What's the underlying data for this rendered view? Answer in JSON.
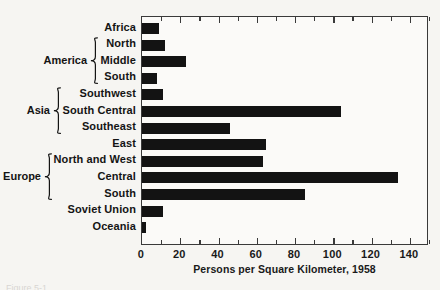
{
  "chart_data": {
    "type": "bar",
    "orientation": "horizontal",
    "title": "",
    "xlabel": "Persons per Square Kilometer, 1958",
    "ylabel": "",
    "xlim": [
      0,
      150
    ],
    "grid": false,
    "legend": null,
    "categories": [
      "Africa",
      "North",
      "Middle",
      "South",
      "Southwest",
      "South Central",
      "Southeast",
      "East",
      "North and West",
      "Central",
      "South",
      "Soviet Union",
      "Oceania"
    ],
    "values": [
      9,
      12,
      23,
      8,
      11,
      104,
      46,
      65,
      63,
      134,
      85,
      11,
      2
    ],
    "xticks": [
      0,
      20,
      40,
      60,
      80,
      100,
      120,
      140
    ],
    "xtick_labels": [
      "0",
      "20",
      "40",
      "60",
      "80",
      "100",
      "120",
      "140"
    ],
    "minor_tick_step": 10,
    "bar_color": "#131313",
    "axis_color": "#3a3a3a",
    "groups": [
      {
        "label": "America",
        "first": 1,
        "last": 3
      },
      {
        "label": "Asia",
        "first": 4,
        "last": 6
      },
      {
        "label": "Europe",
        "first": 8,
        "last": 10
      }
    ]
  },
  "footer": {
    "caption": "Figure 5-1."
  }
}
